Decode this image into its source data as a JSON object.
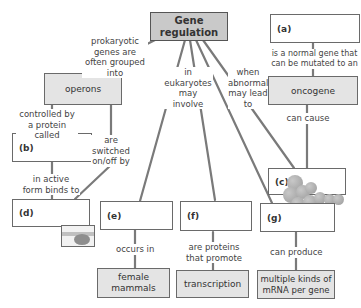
{
  "diagram": {
    "central_concept": "Gene regulation",
    "nodes": {
      "gene_regulation": "Gene regulation",
      "a": "(a)",
      "oncogene": "oncogene",
      "operons": "operons",
      "b": "(b)",
      "c": "(c)",
      "d": "(d)",
      "e": "(e)",
      "f": "(f)",
      "g": "(g)",
      "female_mammals": "female mammals",
      "transcription": "transcription",
      "multiple_mrna": "multiple kinds of mRNA per gene"
    },
    "links": {
      "prokaryotic": "prokaryotic genes are often grouped into",
      "eukaryotes": "in eukaryotes may involve",
      "abnormal": "when abnormal may lead to",
      "normal_gene": "is a normal gene that can be mutated to an",
      "can_cause": "can cause",
      "controlled_by": "controlled by a protein called",
      "switched": "are switched on/off by",
      "active_form": "in active form binds to",
      "occurs_in": "occurs in",
      "are_proteins": "are proteins that promote",
      "can_produce": "can produce"
    },
    "images": {
      "c": "cancer-cells-illustration",
      "d": "dna-binding-illustration"
    },
    "colors": {
      "title_fill": "#c9c9c9",
      "concept_fill": "#e4e4e4",
      "line": "#7a7a7a",
      "border": "#6a6a6a"
    }
  }
}
